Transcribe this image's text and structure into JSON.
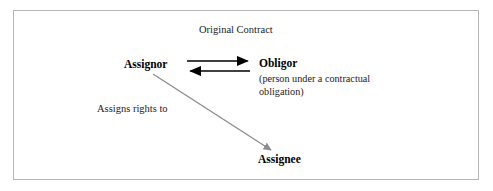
{
  "diagram": {
    "title_caption": "Original Contract",
    "frame": {
      "border_color": "#b6b6b6",
      "background_color": "#ffffff"
    },
    "nodes": [
      {
        "id": "assignor",
        "label": "Assignor",
        "style": "bold"
      },
      {
        "id": "obligor",
        "label": "Obligor",
        "style": "bold",
        "description": "(person under a contractual\nobligation)"
      },
      {
        "id": "assignee",
        "label": "Assignee",
        "style": "bold"
      }
    ],
    "edges": [
      {
        "id": "assignor-to-obligor",
        "from": "assignor",
        "to": "obligor",
        "direction": "right",
        "color": "#000000",
        "label": ""
      },
      {
        "id": "obligor-to-assignor",
        "from": "obligor",
        "to": "assignor",
        "direction": "left",
        "color": "#000000",
        "label": ""
      },
      {
        "id": "assignor-to-assignee",
        "from": "assignor",
        "to": "assignee",
        "direction": "down-right",
        "color": "#8c8c8c",
        "label": "Assigns rights to"
      }
    ],
    "colors": {
      "text": "#000000",
      "body_text": "#1b1b1b",
      "black_arrow": "#000000",
      "gray_arrow": "#8c8c8c",
      "frame": "#b6b6b6"
    }
  }
}
